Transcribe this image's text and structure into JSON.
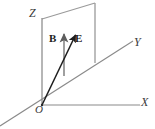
{
  "figure": {
    "kind": "3d-coordinate-axes-vector-diagram",
    "width": 155,
    "height": 129,
    "background_color": "#ffffff"
  },
  "axes": {
    "z": {
      "label": "Z",
      "color": "#3a3a3a"
    },
    "y": {
      "label": "Y",
      "color": "#6a6a6a"
    },
    "x": {
      "label": "X",
      "color": "#6a6a6a"
    },
    "origin": {
      "label": "O",
      "color": "#3a3a3a"
    }
  },
  "vectors": [
    {
      "name": "magnetic-field",
      "label": "B",
      "color": "#8a8a8a",
      "direction": "vertical-up",
      "from": [
        64,
        76
      ],
      "to": [
        64,
        31
      ]
    },
    {
      "name": "electric-field",
      "label": "E",
      "color": "#1d1d1d",
      "direction": "up-right-from-origin",
      "from": [
        42,
        105
      ],
      "to": [
        77,
        32
      ]
    }
  ],
  "plane": {
    "name": "vertical-plane",
    "color": "#8a8a8a",
    "corners": [
      [
        42,
        19
      ],
      [
        95,
        3
      ],
      [
        95,
        63
      ],
      [
        42,
        105
      ]
    ]
  }
}
